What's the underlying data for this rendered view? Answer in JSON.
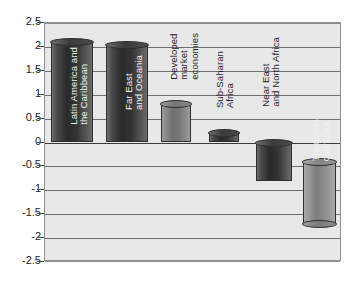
{
  "chart_data": {
    "type": "bar",
    "title": "",
    "subtitle": "",
    "xlabel": "",
    "ylabel": "",
    "ylim": [
      -2.5,
      2.5
    ],
    "grid": true,
    "legend": "none",
    "orientation": "vertical",
    "style": "3d-cylinder-grayscale",
    "ytick_labels": [
      "2.5",
      "2",
      "1.5",
      "1",
      "0.5",
      "0",
      "-0.5",
      "-1",
      "-1.5",
      "-2",
      "-2.5"
    ],
    "ytick_values": [
      2.5,
      2,
      1.5,
      1,
      0.5,
      0,
      -0.5,
      -1,
      -1.5,
      -2,
      -2.5
    ],
    "categories": [
      "Latin America and the Caribbean",
      "Far East and Oceania",
      "Developed market economies",
      "Sub-Saharan Africa",
      "Near East and North Africa",
      "Transition countries"
    ],
    "values": [
      2.1,
      2.05,
      0.8,
      0.2,
      -0.8,
      -1.7
    ],
    "bars": [
      {
        "category": "Latin America and the Caribbean",
        "label": "Latin America and\nthe Caribbean",
        "value": 2.1,
        "base": 0,
        "label_placement": "on-bar",
        "shade": "dark"
      },
      {
        "category": "Far East and Oceania",
        "label": "Far East\nand Oceania",
        "value": 2.05,
        "base": 0,
        "label_placement": "on-bar",
        "shade": "dark"
      },
      {
        "category": "Developed market economies",
        "label": "Developed\nmarket\neconomies",
        "value": 0.8,
        "base": 0,
        "label_placement": "above-bar",
        "shade": "mid"
      },
      {
        "category": "Sub-Saharan Africa",
        "label": "Sub-Saharan\nAfrica",
        "value": 0.2,
        "base": 0,
        "label_placement": "above-bar",
        "shade": "dark"
      },
      {
        "category": "Near East and North Africa",
        "label": "Near East\nand North Africa",
        "value": -0.8,
        "base": 0,
        "label_placement": "above-bar",
        "shade": "dark"
      },
      {
        "category": "Transition countries",
        "label": "Transition\ncountries",
        "value": -1.7,
        "base": -0.4,
        "label_placement": "on-bar",
        "shade": "light"
      }
    ]
  }
}
